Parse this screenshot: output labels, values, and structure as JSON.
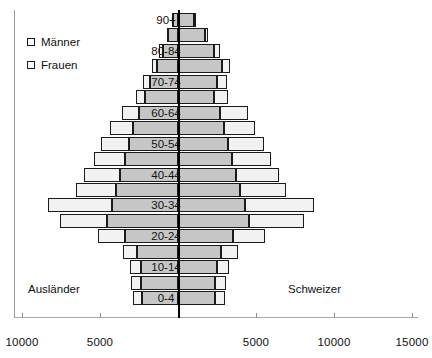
{
  "legend": {
    "items": [
      {
        "label": "Männer",
        "marker": "square-outline-icon"
      },
      {
        "label": "Frauen",
        "marker": "square-outline-icon"
      }
    ]
  },
  "captions": {
    "left": "Ausländer",
    "right": "Schweizer"
  },
  "axis": {
    "ticks": [
      {
        "label": "10000",
        "value": -10000
      },
      {
        "label": "5000",
        "value": -5000
      },
      {
        "label": "",
        "value": 0
      },
      {
        "label": "5000",
        "value": 5000
      },
      {
        "label": "10000",
        "value": 10000
      },
      {
        "label": "15000",
        "value": 15000
      }
    ]
  },
  "colors": {
    "schweizer": "#c6c6c6",
    "auslaender": "#f2f2f2",
    "outline": "#1b1b1b",
    "axis": "#000000",
    "frame": "#9a9a9a"
  },
  "chart_data": {
    "type": "bar",
    "subtype": "population-pyramid",
    "title": "",
    "xlabel": "",
    "ylabel": "",
    "xlim": [
      -12500,
      15500
    ],
    "grid": false,
    "legend_position": "upper-left",
    "orientation": "horizontal",
    "stacked": true,
    "left_side": "Männer",
    "right_side": "Frauen",
    "categories": [
      "90+",
      "85-89",
      "80-84",
      "75-79",
      "70-74",
      "65-69",
      "60-64",
      "55-59",
      "50-54",
      "45-49",
      "40-44",
      "35-39",
      "30-34",
      "25-29",
      "20-24",
      "15-19",
      "10-14",
      "5-9",
      "0-4"
    ],
    "visible_category_labels": [
      "90+",
      "80-84",
      "70-74",
      "60-64",
      "50-54",
      "40-44",
      "30-34",
      "20-24",
      "10-14",
      "0-4"
    ],
    "series": [
      {
        "name": "Männer Schweizer",
        "side": "left",
        "stack": "inner",
        "values": [
          330,
          620,
          990,
          1350,
          1800,
          2100,
          2520,
          2900,
          3150,
          3400,
          3700,
          3950,
          4250,
          4550,
          3400,
          2600,
          2400,
          2350,
          2300
        ]
      },
      {
        "name": "Männer Ausländer",
        "side": "left",
        "stack": "outer",
        "values": [
          60,
          110,
          200,
          310,
          430,
          620,
          1100,
          1450,
          1800,
          2000,
          2350,
          2600,
          4100,
          3000,
          1700,
          900,
          700,
          640,
          600
        ]
      },
      {
        "name": "Frauen Schweizer",
        "side": "right",
        "stack": "inner",
        "values": [
          1050,
          1730,
          2300,
          2800,
          2500,
          2300,
          2700,
          2950,
          3200,
          3450,
          3700,
          3950,
          4300,
          4550,
          3500,
          2750,
          2500,
          2400,
          2350
        ]
      },
      {
        "name": "Frauen Ausländer",
        "side": "right",
        "stack": "outer",
        "values": [
          120,
          210,
          380,
          550,
          640,
          880,
          1800,
          2000,
          2300,
          2500,
          2750,
          3000,
          4400,
          3500,
          2100,
          1100,
          800,
          700,
          650
        ]
      }
    ]
  }
}
